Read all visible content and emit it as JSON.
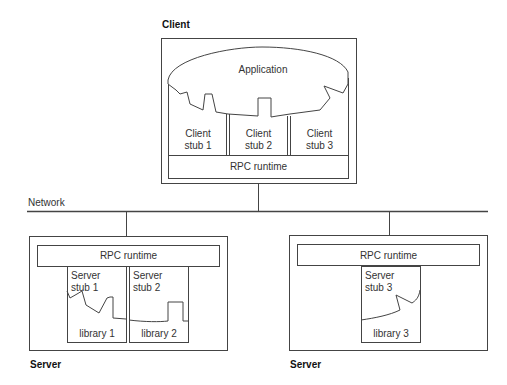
{
  "client": {
    "title": "Client",
    "application": "Application",
    "stubs": [
      {
        "line1": "Client",
        "line2": "stub 1"
      },
      {
        "line1": "Client",
        "line2": "stub 2"
      },
      {
        "line1": "Client",
        "line2": "stub 3"
      }
    ],
    "runtime": "RPC runtime"
  },
  "network": {
    "label": "Network"
  },
  "servers": [
    {
      "title": "Server",
      "runtime": "RPC runtime",
      "stubs": [
        {
          "line1": "Server",
          "line2": "stub 1",
          "library": "library 1"
        },
        {
          "line1": "Server",
          "line2": "stub 2",
          "library": "library 2"
        }
      ]
    },
    {
      "title": "Server",
      "runtime": "RPC runtime",
      "stubs": [
        {
          "line1": "Server",
          "line2": "stub 3",
          "library": "library 3"
        }
      ]
    }
  ],
  "colors": {
    "line": "#444444",
    "text": "#333333",
    "background": "#ffffff"
  }
}
